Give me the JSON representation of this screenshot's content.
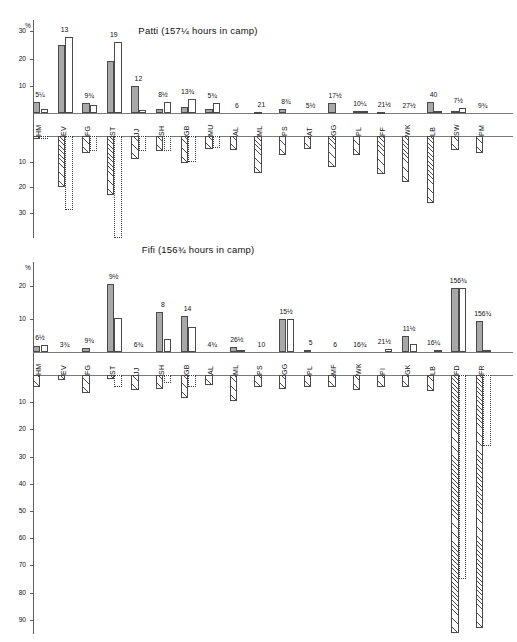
{
  "page": {
    "width": 517,
    "height": 642,
    "background": "#ffffff"
  },
  "axis_unit_symbol": "%",
  "panels": [
    {
      "id": "patti",
      "title": "Patti   (157¼ hours in camp)",
      "subject": "Patti",
      "hours_in_camp": "157¼",
      "pos_ticks": [
        10,
        20,
        30
      ],
      "neg_ticks": [
        10,
        20,
        30
      ],
      "pos_max": 34,
      "neg_max": 40
    },
    {
      "id": "fifi",
      "title": "Fifi   (156¾ hours in camp)",
      "subject": "Fifi",
      "hours_in_camp": "156¾",
      "pos_ticks": [
        10,
        20
      ],
      "neg_ticks": [
        10,
        20,
        30,
        40,
        50,
        60,
        70,
        80,
        90
      ],
      "pos_max": 24,
      "neg_max": 97
    }
  ],
  "chart_data": [
    {
      "type": "bar",
      "title": "Patti   (157¼ hours in camp)",
      "subtitle": "",
      "xlabel": "",
      "ylabel": "%",
      "ylim": [
        -34,
        34
      ],
      "grid": false,
      "legend": "none",
      "orientation": "vertical-diverging",
      "note": "Paired bars per category: above-axis (solid grey = observed, open = expected); below-axis (hatched and dotted-outline = negative deviations).",
      "categories": [
        "HM",
        "EV",
        "FG",
        "ST",
        "JJ",
        "SH",
        "GB",
        "MU",
        "AL",
        "ML",
        "PS",
        "AT",
        "GG",
        "PL",
        "FF",
        "WK",
        "LB",
        "SW",
        "PM"
      ],
      "data_labels": [
        "5¼",
        "13",
        "9¾",
        "19",
        "12",
        "8½",
        "13¾",
        "5¾",
        "6",
        "21",
        "8¾",
        "5½",
        "17½",
        "10¼",
        "21½",
        "27½",
        "40",
        "7½",
        "9¾"
      ],
      "series": [
        {
          "name": "positive-solid",
          "pattern": "solid-grey",
          "values": [
            4.0,
            25.0,
            3.6,
            19.0,
            10.0,
            1.5,
            2.2,
            1.5,
            0,
            0.5,
            1.3,
            0,
            3.8,
            0.7,
            0.4,
            0,
            3.9,
            0.6,
            0
          ]
        },
        {
          "name": "positive-open",
          "pattern": "open-white",
          "values": [
            1.6,
            28.0,
            2.9,
            26.0,
            1.1,
            4.2,
            5.3,
            3.5,
            0,
            0,
            0,
            0,
            0,
            0.8,
            0,
            0,
            0.6,
            2.0,
            0
          ]
        },
        {
          "name": "negative-hatched",
          "pattern": "diagonal-hatch",
          "values": [
            -1.2,
            -20.0,
            -6.5,
            -23.0,
            -9.0,
            -6.0,
            -10.5,
            -5.0,
            -5.5,
            -14.5,
            -7.5,
            -5.0,
            -12.0,
            -7.5,
            -15.0,
            -18.0,
            -26.0,
            -5.5,
            -6.5
          ]
        },
        {
          "name": "negative-dotted",
          "pattern": "dotted-outline",
          "values": [
            -1.0,
            -29.0,
            -5.8,
            -40.0,
            -6.0,
            -6.0,
            -10.0,
            -4.5,
            0,
            0,
            0,
            0,
            0,
            0,
            0,
            0,
            0,
            0,
            0
          ]
        }
      ]
    },
    {
      "type": "bar",
      "title": "Fifi   (156¾ hours in camp)",
      "subtitle": "",
      "xlabel": "",
      "ylabel": "%",
      "ylim": [
        -97,
        24
      ],
      "grid": false,
      "legend": "none",
      "orientation": "vertical-diverging",
      "note": "Paired bars per category: above-axis (solid grey = observed, open = expected); below-axis (hatched and dotted-outline = negative deviations).",
      "categories": [
        "HM",
        "EV",
        "FG",
        "ST",
        "JJ",
        "SH",
        "GB",
        "AL",
        "ML",
        "PS",
        "GG",
        "PL",
        "MF",
        "WK",
        "PI",
        "GK",
        "LB",
        "FD",
        "FR"
      ],
      "data_labels": [
        "6½",
        "3¾",
        "9¾",
        "9½",
        "6¾",
        "8",
        "14",
        "4¾",
        "26½",
        "10",
        "15½",
        "5",
        "6",
        "16¾",
        "21½",
        "11½",
        "16¼",
        "156¾",
        "156¾"
      ],
      "series": [
        {
          "name": "positive-solid",
          "pattern": "solid-grey",
          "values": [
            1.8,
            0,
            1.2,
            20.5,
            0,
            12.0,
            11.0,
            0,
            1.5,
            0,
            10.0,
            0.6,
            0,
            0,
            0,
            5.0,
            0,
            19.5,
            9.5
          ]
        },
        {
          "name": "positive-open",
          "pattern": "open-white",
          "values": [
            2.0,
            0,
            0,
            10.2,
            0,
            4.0,
            7.5,
            0,
            0.5,
            0,
            10.0,
            0,
            0,
            0,
            0.8,
            2.5,
            0.5,
            19.5,
            0.7
          ]
        },
        {
          "name": "negative-hatched",
          "pattern": "diagonal-hatch",
          "values": [
            -4.5,
            -2.0,
            -6.5,
            -1.5,
            -5.5,
            -5.0,
            -8.5,
            -3.5,
            -9.5,
            -4.5,
            -5.0,
            -4.5,
            -4.5,
            -5.5,
            -4.5,
            -4.5,
            -6.0,
            -95.0,
            -93.0
          ]
        },
        {
          "name": "negative-dotted",
          "pattern": "dotted-outline",
          "values": [
            0,
            0,
            0,
            -4.5,
            0,
            -3.0,
            -4.5,
            0,
            0,
            0,
            0,
            0,
            0,
            0,
            0,
            0,
            0,
            -75.0,
            -26.0
          ]
        }
      ]
    }
  ]
}
